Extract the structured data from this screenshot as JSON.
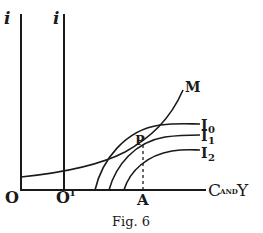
{
  "figure": {
    "caption": "Fig. 6",
    "axes": {
      "vertical_left_label": "i",
      "vertical_right_label": "i",
      "horizontal_label_main": "C",
      "horizontal_label_small": "AND",
      "horizontal_label_end": "Y",
      "origin_label": "O",
      "second_origin_label": "O",
      "second_origin_superscript": "1"
    },
    "curves": {
      "m_label": "M",
      "i0_label": "I",
      "i0_subscript": "0",
      "i1_label": "I",
      "i1_subscript": "1",
      "i2_label": "I",
      "i2_subscript": "2"
    },
    "points": {
      "intersection_label": "P",
      "foot_label": "A"
    },
    "colors": {
      "ink": "#1a1a1a",
      "background": "#ffffff"
    }
  }
}
